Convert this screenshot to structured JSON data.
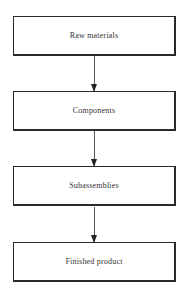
{
  "diagram": {
    "type": "flowchart",
    "direction": "top-to-bottom",
    "nodes": [
      {
        "id": "raw",
        "label": "Raw materials"
      },
      {
        "id": "comp",
        "label": "Components"
      },
      {
        "id": "sub",
        "label": "Subassemblies"
      },
      {
        "id": "fin",
        "label": "Finished product"
      }
    ],
    "edges": [
      {
        "from": "raw",
        "to": "comp"
      },
      {
        "from": "comp",
        "to": "sub"
      },
      {
        "from": "sub",
        "to": "fin"
      }
    ]
  }
}
